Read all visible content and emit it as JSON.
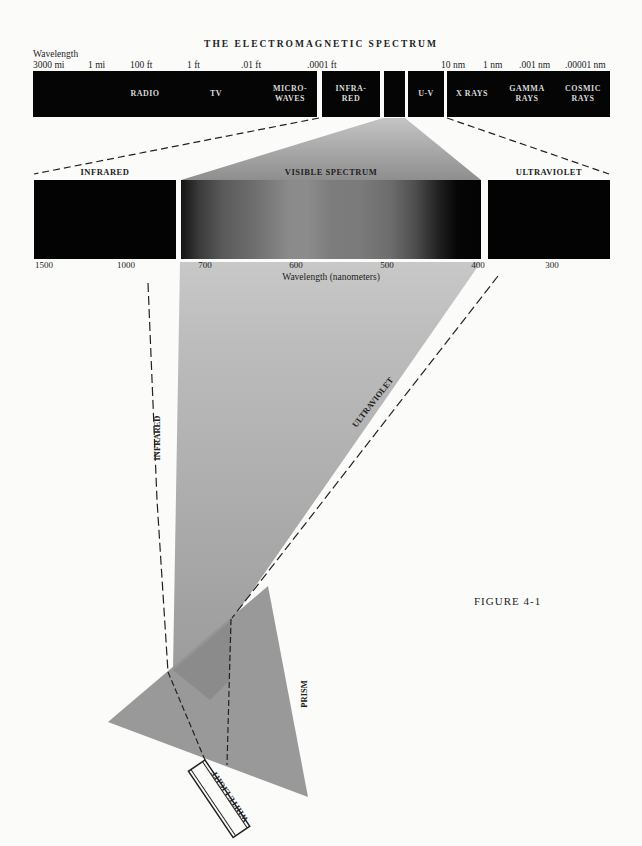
{
  "title": "THE ELECTROMAGNETIC SPECTRUM",
  "top_scale": {
    "axis_label": "Wavelength",
    "ticks": [
      {
        "label": "3000 mi",
        "x": 33
      },
      {
        "label": "1 mi",
        "x": 88
      },
      {
        "label": "100 ft",
        "x": 130
      },
      {
        "label": "1 ft",
        "x": 187
      },
      {
        "label": ".01 ft",
        "x": 241
      },
      {
        "label": ".0001 ft",
        "x": 307
      },
      {
        "label": "10 nm",
        "x": 441
      },
      {
        "label": "1 nm",
        "x": 483
      },
      {
        "label": ".001 nm",
        "x": 519
      },
      {
        "label": ".00001 nm",
        "x": 565
      }
    ],
    "bands": [
      {
        "id": "radio-tv-microwaves",
        "labels": [
          "RADIO",
          "TV",
          "MICRO-\nWAVES"
        ]
      },
      {
        "id": "infrared",
        "label": "INFRA-\nRED"
      },
      {
        "id": "visible",
        "label": ""
      },
      {
        "id": "ultraviolet",
        "label": "U-V"
      },
      {
        "id": "xray-gamma-cosmic",
        "labels": [
          "X RAYS",
          "GAMMA\nRAYS",
          "COSMIC\nRAYS"
        ]
      }
    ]
  },
  "detail": {
    "infrared_title": "INFRARED",
    "visible_title": "VISIBLE SPECTRUM",
    "ultraviolet_title": "ULTRAVIOLET",
    "ticks": [
      {
        "label": "1500",
        "x": 44
      },
      {
        "label": "1000",
        "x": 126
      },
      {
        "label": "700",
        "x": 205
      },
      {
        "label": "600",
        "x": 296
      },
      {
        "label": "500",
        "x": 387
      },
      {
        "label": "400",
        "x": 478
      },
      {
        "label": "300",
        "x": 552
      }
    ],
    "axis_label": "Wavelength (nanometers)"
  },
  "beam_labels": {
    "infrared": "INFRARED",
    "ultraviolet": "ULTRAVIOLET",
    "prism": "PRISM",
    "white_light": "WHITE LIGHT"
  },
  "figure_caption": "FIGURE 4-1",
  "colors": {
    "band_fill": "#050505",
    "beam_gray": "#9a9a9a",
    "prism_gray": "#8f8f8f",
    "background": "#fbfbfa"
  }
}
